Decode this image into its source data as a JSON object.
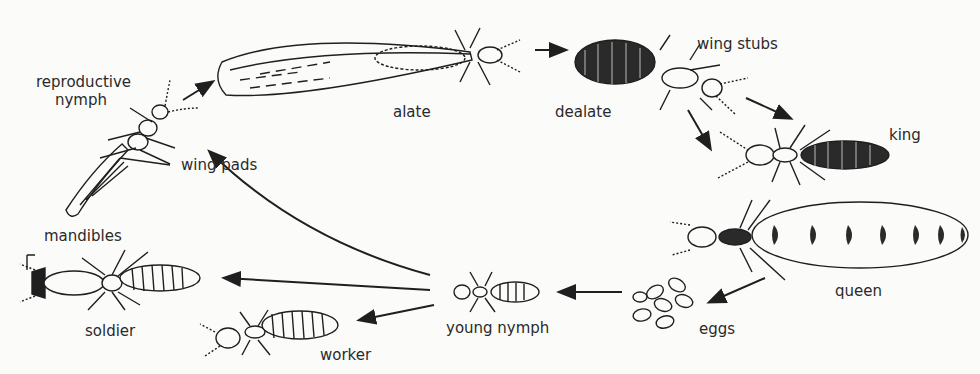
{
  "diagram": {
    "colors": {
      "background": "#fbfbfa",
      "ink": "#1f1f1f",
      "ghost_text": "#ececea"
    },
    "labels": {
      "reproductive_nymph_1": "reproductive",
      "reproductive_nymph_2": "nymph",
      "wing_pads": "wing pads",
      "alate": "alate",
      "dealate": "dealate",
      "wing_stubs": "wing stubs",
      "king": "king",
      "queen": "queen",
      "eggs": "eggs",
      "young_nymph": "young nymph",
      "worker": "worker",
      "soldier": "soldier",
      "mandibles": "mandibles"
    },
    "flow": [
      {
        "from": "reproductive nymph",
        "to": "alate"
      },
      {
        "from": "alate",
        "to": "dealate"
      },
      {
        "from": "dealate",
        "to": "king"
      },
      {
        "from": "dealate",
        "to": "queen"
      },
      {
        "from": "queen",
        "to": "eggs"
      },
      {
        "from": "eggs",
        "to": "young nymph"
      },
      {
        "from": "young nymph",
        "to": "reproductive nymph"
      },
      {
        "from": "young nymph",
        "to": "soldier"
      },
      {
        "from": "young nymph",
        "to": "worker"
      }
    ]
  }
}
